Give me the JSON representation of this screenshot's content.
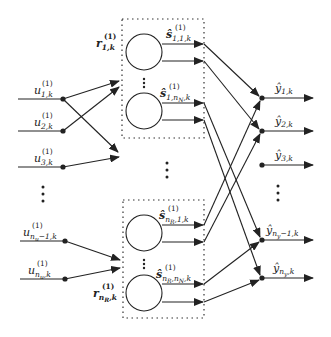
{
  "diagram": {
    "type": "neural-network-ensemble",
    "inputs": [
      {
        "id": "u1",
        "base": "u",
        "sup": "(1)",
        "sub": "1,k"
      },
      {
        "id": "u2",
        "base": "u",
        "sup": "(1)",
        "sub": "2,k"
      },
      {
        "id": "u3",
        "base": "u",
        "sup": "(1)",
        "sub": "3,k"
      },
      {
        "id": "unu1",
        "base": "u",
        "sup": "(1)",
        "sub": "n",
        "subsub": "u",
        "subtail": "−1,k"
      },
      {
        "id": "unu",
        "base": "u",
        "sup": "(1)",
        "sub": "n",
        "subsub": "u",
        "subtail": ",k"
      }
    ],
    "regressors": [
      {
        "id": "r1",
        "base": "r",
        "sup": "(1)",
        "sub": "1,k"
      },
      {
        "id": "rnR",
        "base": "r",
        "sup": "(1)",
        "sub": "n",
        "subsub": "R",
        "subtail": ",k"
      }
    ],
    "submodel_outputs": [
      {
        "id": "s11",
        "base": "ŝ",
        "sup": "(1)",
        "sub": "1,1,k"
      },
      {
        "id": "s1nN",
        "base": "ŝ",
        "sup": "(1)",
        "sub": "1,n",
        "subsub": "N",
        "subtail": ",k"
      },
      {
        "id": "snR1",
        "base": "ŝ",
        "sup": "(1)",
        "sub": "n",
        "subsub": "R",
        "subtail": ",1,k"
      },
      {
        "id": "snRnN",
        "base": "ŝ",
        "sup": "(1)",
        "sub": "n",
        "subsub": "R",
        "subtail": ",n",
        "subsub2": "N",
        "subtail2": ",k"
      }
    ],
    "outputs": [
      {
        "id": "y1",
        "base": "ŷ",
        "sub": "1,k"
      },
      {
        "id": "y2",
        "base": "ŷ",
        "sub": "2,k"
      },
      {
        "id": "y3",
        "base": "ŷ",
        "sub": "3,k"
      },
      {
        "id": "yny1",
        "base": "ŷ",
        "sub": "n",
        "subsub": "y",
        "subtail": "−1,k"
      },
      {
        "id": "yny",
        "base": "ŷ",
        "sub": "n",
        "subsub": "y",
        "subtail": ",k"
      }
    ],
    "ellipsis": "⋮",
    "colors": {
      "stroke": "#222222",
      "background": "#ffffff"
    }
  }
}
